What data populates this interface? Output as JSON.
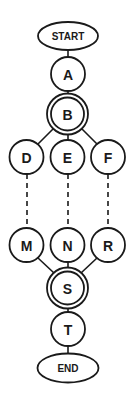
{
  "diagram": {
    "type": "flow-graph",
    "colors": {
      "stroke": "#1a1a1a",
      "fill": "#ffffff",
      "background": "#ffffff"
    },
    "nodes": {
      "start": {
        "label": "START",
        "shape": "ellipse"
      },
      "a": {
        "label": "A",
        "shape": "circle"
      },
      "b": {
        "label": "B",
        "shape": "double-circle"
      },
      "d": {
        "label": "D",
        "shape": "circle"
      },
      "e": {
        "label": "E",
        "shape": "circle"
      },
      "f": {
        "label": "F",
        "shape": "circle"
      },
      "m": {
        "label": "M",
        "shape": "circle"
      },
      "n": {
        "label": "N",
        "shape": "circle"
      },
      "r": {
        "label": "R",
        "shape": "circle"
      },
      "s": {
        "label": "S",
        "shape": "double-circle"
      },
      "t": {
        "label": "T",
        "shape": "circle"
      },
      "end": {
        "label": "END",
        "shape": "ellipse"
      }
    },
    "edges": [
      {
        "from": "START",
        "to": "A",
        "style": "solid"
      },
      {
        "from": "A",
        "to": "B",
        "style": "solid"
      },
      {
        "from": "B",
        "to": "D",
        "style": "solid"
      },
      {
        "from": "B",
        "to": "E",
        "style": "solid"
      },
      {
        "from": "B",
        "to": "F",
        "style": "solid"
      },
      {
        "from": "D",
        "to": "M",
        "style": "dashed"
      },
      {
        "from": "E",
        "to": "N",
        "style": "dashed"
      },
      {
        "from": "F",
        "to": "R",
        "style": "dashed"
      },
      {
        "from": "M",
        "to": "S",
        "style": "solid"
      },
      {
        "from": "N",
        "to": "S",
        "style": "solid"
      },
      {
        "from": "R",
        "to": "S",
        "style": "solid"
      },
      {
        "from": "S",
        "to": "T",
        "style": "solid"
      },
      {
        "from": "T",
        "to": "END",
        "style": "solid"
      }
    ]
  }
}
